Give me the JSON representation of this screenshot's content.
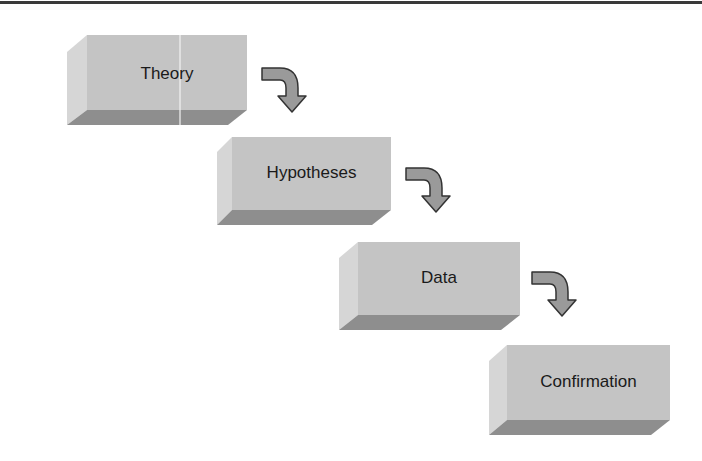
{
  "diagram": {
    "type": "staircase-flow",
    "steps": [
      {
        "label": "Theory"
      },
      {
        "label": "Hypotheses"
      },
      {
        "label": "Data"
      },
      {
        "label": "Confirmation"
      }
    ],
    "connectors": [
      {
        "from": "Theory",
        "to": "Hypotheses",
        "icon": "curved-arrow-down-right"
      },
      {
        "from": "Hypotheses",
        "to": "Data",
        "icon": "curved-arrow-down-right"
      },
      {
        "from": "Data",
        "to": "Confirmation",
        "icon": "curved-arrow-down-right"
      }
    ]
  },
  "colors": {
    "front_face": "#c4c4c4",
    "side_face": "#d6d6d6",
    "bottom_face": "#8e8e8e",
    "arrow_fill": "#9a9a9a",
    "arrow_stroke": "#333333",
    "text": "#1a1a1a",
    "top_rule": "#3a3a3a"
  }
}
